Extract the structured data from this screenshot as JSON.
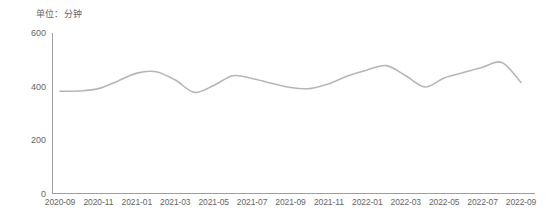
{
  "chart_data": {
    "type": "line",
    "title": "单位：分钟",
    "xlabel": "",
    "ylabel": "",
    "ylim": [
      0,
      600
    ],
    "yticks": [
      0,
      200,
      400,
      600
    ],
    "grid": false,
    "legend": null,
    "line_color": "#b6b6b6",
    "axis_color": "#9aa0a6",
    "tick_label_color": "#666666",
    "x_tick_labels": [
      "2020-09",
      "2020-11",
      "2021-01",
      "2021-03",
      "2021-05",
      "2021-07",
      "2021-09",
      "2021-11",
      "2022-01",
      "2022-03",
      "2022-05",
      "2022-07",
      "2022-09"
    ],
    "categories": [
      "2020-09",
      "2020-10",
      "2020-11",
      "2020-12",
      "2021-01",
      "2021-02",
      "2021-03",
      "2021-04",
      "2021-05",
      "2021-06",
      "2021-07",
      "2021-08",
      "2021-09",
      "2021-10",
      "2021-11",
      "2021-12",
      "2022-01",
      "2022-02",
      "2022-03",
      "2022-04",
      "2022-05",
      "2022-06",
      "2022-07",
      "2022-08",
      "2022-09"
    ],
    "values": [
      382,
      383,
      392,
      420,
      450,
      455,
      424,
      378,
      404,
      440,
      430,
      412,
      396,
      392,
      410,
      440,
      462,
      478,
      440,
      398,
      432,
      452,
      472,
      490,
      415
    ],
    "series": [
      {
        "name": "人均单日使用时长",
        "values": [
          382,
          383,
          392,
          420,
          450,
          455,
          424,
          378,
          404,
          440,
          430,
          412,
          396,
          392,
          410,
          440,
          462,
          478,
          440,
          398,
          432,
          452,
          472,
          490,
          415
        ]
      }
    ]
  },
  "axes": {
    "y_labels": [
      {
        "text": "600",
        "value": 600
      },
      {
        "text": "400",
        "value": 400
      },
      {
        "text": "200",
        "value": 200
      },
      {
        "text": "0",
        "value": 0
      }
    ]
  }
}
